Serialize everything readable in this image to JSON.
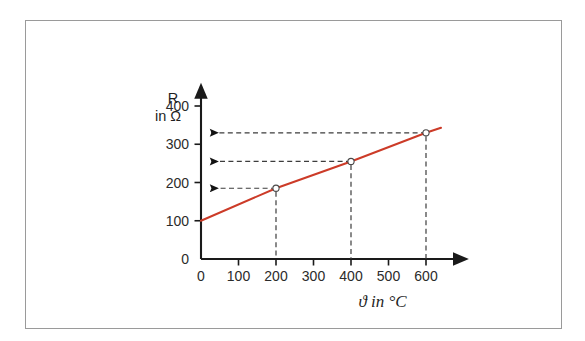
{
  "figure": {
    "background_color": "#ffffff",
    "frame_color": "#9a9a9a"
  },
  "chart_data": {
    "type": "line",
    "title": "",
    "subtitle": "",
    "xlabel": "ϑ  in °C",
    "ylabel_line1": "R",
    "ylabel_line2": "in Ω",
    "x": [
      0,
      200,
      400,
      600
    ],
    "values": [
      100,
      185,
      255,
      330
    ],
    "series": [
      {
        "name": "R(ϑ)",
        "color": "#cc3b28",
        "x": [
          0,
          200,
          400,
          600,
          640
        ],
        "values": [
          100,
          185,
          255,
          330,
          343
        ]
      }
    ],
    "markers": [
      {
        "x": 200,
        "y": 185
      },
      {
        "x": 400,
        "y": 255
      },
      {
        "x": 600,
        "y": 330
      }
    ],
    "readout_arrows": [
      {
        "x": 200,
        "y": 185
      },
      {
        "x": 400,
        "y": 255
      },
      {
        "x": 600,
        "y": 330
      }
    ],
    "xticks": [
      0,
      100,
      200,
      300,
      400,
      500,
      600
    ],
    "xtick_labels": [
      "0",
      "100",
      "200",
      "300",
      "400",
      "500",
      "600"
    ],
    "yticks": [
      0,
      100,
      200,
      300,
      400
    ],
    "ytick_labels": [
      "0",
      "100",
      "200",
      "300",
      "400"
    ],
    "xlim": [
      0,
      640
    ],
    "ylim": [
      0,
      440
    ],
    "grid": false,
    "legend": false,
    "legend_position": "none",
    "line_color": "#cc3b28",
    "axis_color": "#1a1a1a",
    "guide_color": "#3d3d3d"
  }
}
